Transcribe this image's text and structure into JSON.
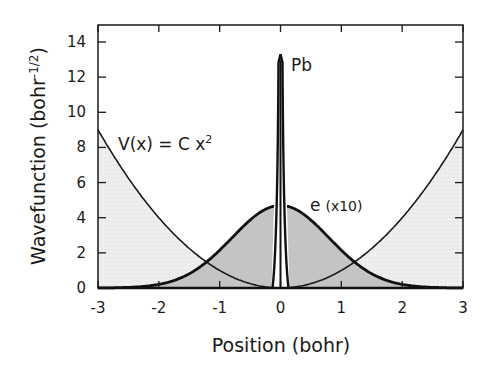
{
  "chart_data": {
    "type": "area",
    "title": "",
    "xlabel": "Position (bohr)",
    "ylabel": "Wavefunction (bohr",
    "ylabel_sup": "-1/2",
    "ylabel_close": ")",
    "xlim": [
      -3,
      3
    ],
    "ylim": [
      0,
      15
    ],
    "xticks": [
      "-3",
      "-2",
      "-1",
      "0",
      "1",
      "2",
      "3"
    ],
    "yticks": [
      "0",
      "2",
      "4",
      "6",
      "8",
      "10",
      "12",
      "14"
    ],
    "grid": false,
    "series": [
      {
        "name": "V(x) = C x^2",
        "kind": "potential",
        "C": 1.0,
        "x": [
          -3,
          -2,
          -1,
          0,
          1,
          2,
          3
        ],
        "values": [
          9,
          4,
          1,
          0,
          1,
          4,
          9
        ]
      },
      {
        "name": "e (x10)",
        "kind": "gaussian",
        "peak": 4.7,
        "center": 0,
        "sigma": 0.8,
        "x": [
          -3,
          -2,
          -1,
          0,
          1,
          2,
          3
        ],
        "values": [
          0.0,
          0.2,
          2.1,
          4.7,
          2.1,
          0.2,
          0.0
        ]
      },
      {
        "name": "Pb",
        "kind": "spike",
        "peak": 13.3,
        "center": 0,
        "width": 0.05
      }
    ],
    "annotations": {
      "potential_label": "V(x) = C x",
      "potential_sup": "2",
      "electron_label": "e",
      "electron_scale": "(x10)",
      "nucleus_label": "Pb"
    }
  }
}
